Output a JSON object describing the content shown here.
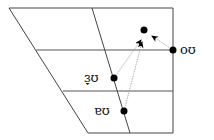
{
  "diagram": {
    "type": "vowel-quadrilateral",
    "colors": {
      "line": "#444444",
      "dot": "#000000",
      "arrow": "#888888"
    },
    "points": [
      {
        "id": "target",
        "x": 144,
        "y": 30,
        "label": ""
      },
      {
        "id": "ou",
        "x": 173,
        "y": 50,
        "label": "oʊ"
      },
      {
        "id": "3u",
        "x": 114,
        "y": 78,
        "label": "ɜ̞ʊ"
      },
      {
        "id": "bu",
        "x": 124,
        "y": 111,
        "label": "ɐʊ"
      }
    ],
    "labels": {
      "ou": "oʊ",
      "3u": "ɜ̞ʊ",
      "bu": "ɐʊ"
    }
  }
}
